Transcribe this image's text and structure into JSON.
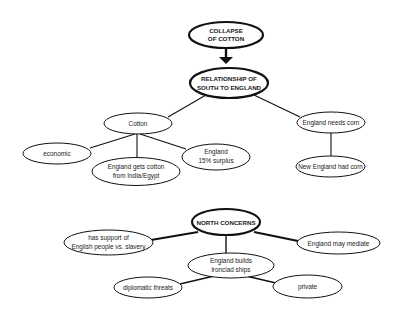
{
  "diagram": {
    "type": "concept-map",
    "nodes": {
      "collapse": {
        "lines": [
          "COLLAPSE",
          "OF COTTON"
        ],
        "emphasis": "bold"
      },
      "relationship": {
        "lines": [
          "RELATIONSHIP OF",
          "SOUTH TO ENGLAND"
        ],
        "emphasis": "bold"
      },
      "cotton": {
        "lines": [
          "Cotton"
        ]
      },
      "economic": {
        "lines": [
          "economic"
        ]
      },
      "india_egypt": {
        "lines": [
          "England gets cotton",
          "from India/Egypt"
        ]
      },
      "surplus": {
        "lines": [
          "England",
          "15%  surplus"
        ]
      },
      "needs_corn": {
        "lines": [
          "England needs corn"
        ]
      },
      "had_corn": {
        "lines": [
          "New England had corn"
        ]
      },
      "north": {
        "lines": [
          "NORTH CONCERNS"
        ],
        "emphasis": "bold"
      },
      "support": {
        "lines": [
          "has support of",
          "English people vs. slavery"
        ]
      },
      "mediate": {
        "lines": [
          "England may mediate"
        ]
      },
      "ironclad": {
        "lines": [
          "England builds",
          "ironclad ships"
        ]
      },
      "threats": {
        "lines": [
          "diplomatic  threats"
        ]
      },
      "private": {
        "lines": [
          "private"
        ]
      }
    },
    "edges": [
      {
        "from": "COLLAPSE OF COTTON",
        "to": "RELATIONSHIP OF SOUTH TO ENGLAND",
        "style": "arrow"
      },
      {
        "from": "RELATIONSHIP OF SOUTH TO ENGLAND",
        "to": "Cotton"
      },
      {
        "from": "RELATIONSHIP OF SOUTH TO ENGLAND",
        "to": "England needs corn"
      },
      {
        "from": "Cotton",
        "to": "economic"
      },
      {
        "from": "Cotton",
        "to": "England gets cotton from India/Egypt"
      },
      {
        "from": "Cotton",
        "to": "England 15% surplus"
      },
      {
        "from": "England needs corn",
        "to": "New England had corn"
      },
      {
        "from": "NORTH CONCERNS",
        "to": "has support of English people vs. slavery"
      },
      {
        "from": "NORTH CONCERNS",
        "to": "England may mediate"
      },
      {
        "from": "NORTH CONCERNS",
        "to": "England builds ironclad ships"
      },
      {
        "from": "England builds ironclad ships",
        "to": "diplomatic threats"
      },
      {
        "from": "England builds ironclad ships",
        "to": "private"
      }
    ],
    "colors": {
      "stroke": "#111111",
      "background": "#ffffff",
      "text": "#1a1a1a"
    }
  }
}
